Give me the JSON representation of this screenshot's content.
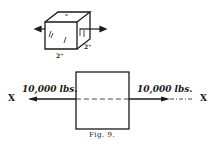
{
  "figure": {
    "caption": "Fig. 9.",
    "cube": {
      "dim_front": "2\"",
      "dim_side": "2\""
    },
    "block": {
      "left_force": "10,000 lbs.",
      "right_force": "10,000 lbs.",
      "left_axis": "X",
      "right_axis": "X"
    }
  }
}
